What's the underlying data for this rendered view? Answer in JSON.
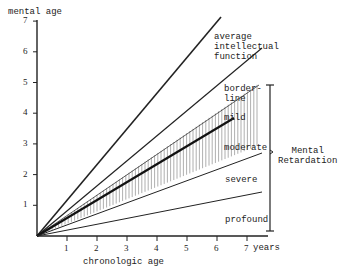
{
  "chart_data": {
    "type": "line",
    "title": "",
    "xlabel": "chronologic age",
    "ylabel": "mental age",
    "x_unit_label": "years",
    "xlim": [
      0,
      7
    ],
    "ylim": [
      0,
      7
    ],
    "x_ticks": [
      "1",
      "2",
      "3",
      "4",
      "5",
      "6",
      "7"
    ],
    "y_ticks": [
      "1",
      "2",
      "3",
      "4",
      "5",
      "6",
      "7"
    ],
    "grid": false,
    "series": [
      {
        "name": "upper limit average",
        "x": [
          0,
          6.1
        ],
        "y": [
          0,
          7.1
        ],
        "style": "solid-thick"
      },
      {
        "name": "average / borderline boundary",
        "x": [
          0,
          7.5
        ],
        "y": [
          0,
          6.1
        ],
        "style": "solid"
      },
      {
        "name": "borderline / mild boundary",
        "x": [
          0,
          7.4
        ],
        "y": [
          0,
          4.9
        ],
        "style": "solid-thin"
      },
      {
        "name": "mean (center of shaded band)",
        "x": [
          0,
          6.6
        ],
        "y": [
          0,
          3.8
        ],
        "style": "solid-thick"
      },
      {
        "name": "moderate / severe boundary",
        "x": [
          0,
          7.5
        ],
        "y": [
          0,
          2.7
        ],
        "style": "solid"
      },
      {
        "name": "severe / profound boundary",
        "x": [
          0,
          7.5
        ],
        "y": [
          0,
          1.4
        ],
        "style": "solid"
      }
    ],
    "shaded_band": {
      "description": "vertical hatching around mean line (mild to moderate range)",
      "x": [
        0,
        7.4
      ],
      "lower_at_7": 2.8,
      "upper_at_7": 4.7
    },
    "region_labels": [
      "average intellectual function",
      "border-line",
      "mild",
      "moderate",
      "severe",
      "profound"
    ],
    "annotations": [
      {
        "text": "Mental Retardation",
        "type": "bracket",
        "spans": [
          "mild",
          "moderate",
          "severe",
          "profound"
        ]
      }
    ]
  },
  "labels": {
    "ylabel": "mental age",
    "xlabel": "chronologic age",
    "years": "years",
    "average": "average\nintellectual\nfunction",
    "borderline": "border-\nline",
    "mild": "mild",
    "moderate": "moderate",
    "severe": "severe",
    "profound": "profound",
    "mental_retardation": "Mental\nRetardation"
  },
  "ticks": {
    "x": [
      "1",
      "2",
      "3",
      "4",
      "5",
      "6",
      "7"
    ],
    "y": [
      "1",
      "2",
      "3",
      "4",
      "5",
      "6",
      "7"
    ]
  }
}
